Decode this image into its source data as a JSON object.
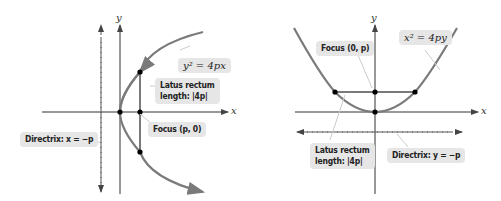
{
  "left_diagram": {
    "equation": "y² = 4px",
    "latus_line1": "Latus rectum",
    "latus_line2": "length: |4p|",
    "focus": "Focus (p, 0)",
    "directrix": "Directrix: x = −p",
    "x_axis": "x",
    "y_axis": "y"
  },
  "right_diagram": {
    "equation": "x² = 4py",
    "focus": "Focus (0, p)",
    "latus_line1": "Latus rectum",
    "latus_line2": "length: |4p|",
    "directrix": "Directrix: y = −p",
    "x_axis": "x",
    "y_axis": "y"
  },
  "colors": {
    "curve": "#7a7a7a",
    "label_bg": "#e6e6e6",
    "axis": "#333333"
  }
}
